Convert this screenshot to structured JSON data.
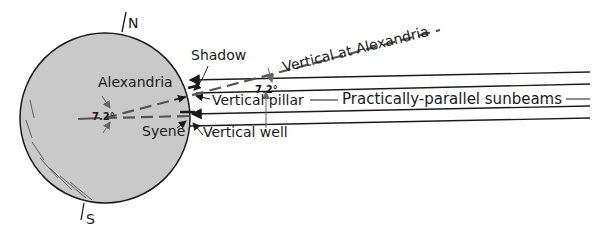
{
  "diagram": {
    "colors": {
      "earth_fill": "#c9c9c9",
      "ink": "#1a1a1a",
      "dashed": "#555555",
      "background": "#ffffff"
    },
    "labels": {
      "north": "N",
      "south": "S",
      "shadow": "Shadow",
      "vertical_at_alexandria": "Vertical at Alexandria",
      "alexandria": "Alexandria",
      "syene": "Syene",
      "angle_center": "7.2°",
      "angle_sun": "7.2°",
      "vertical_pillar": "Vertical pillar",
      "vertical_well": "Vertical well",
      "sunbeams": "Practically-parallel sunbeams"
    }
  }
}
